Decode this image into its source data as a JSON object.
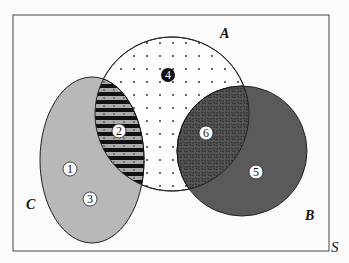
{
  "diagram": {
    "type": "venn",
    "universe_label": "S",
    "sets": [
      {
        "name": "A",
        "label": "A",
        "fill": "dotted-white"
      },
      {
        "name": "B",
        "label": "B",
        "fill": "#5a5a5a"
      },
      {
        "name": "C",
        "label": "C",
        "fill": "#b8b8b8"
      }
    ],
    "regions": [
      {
        "id": "1",
        "label": "1",
        "location": "C only",
        "style": "light"
      },
      {
        "id": "2",
        "label": "2",
        "location": "A ∩ C",
        "style": "light",
        "pattern": "horizontal-stripes"
      },
      {
        "id": "3",
        "label": "3",
        "location": "C only",
        "style": "light"
      },
      {
        "id": "4",
        "label": "4",
        "location": "A only",
        "style": "dark"
      },
      {
        "id": "5",
        "label": "5",
        "location": "B only",
        "style": "light"
      },
      {
        "id": "6",
        "label": "6",
        "location": "A ∩ B",
        "style": "light",
        "pattern": "speckled"
      }
    ],
    "colors": {
      "border": "#333333",
      "C_fill": "#b8b8b8",
      "B_fill": "#5a5a5a",
      "AB_fill": "#4a4a4a",
      "stripe_dark": "#111111",
      "stripe_light": "#a8a8a8",
      "A_fill": "#fdfdfd"
    }
  }
}
